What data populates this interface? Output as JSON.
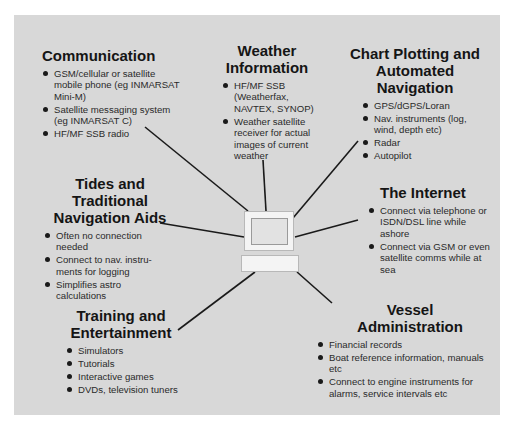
{
  "diagram": {
    "center": {
      "icon": "computer-icon"
    },
    "sections": {
      "communication": {
        "title": "Communication",
        "items": [
          "GSM/cellular or satellite mobile phone (eg INMARSAT Mini-M)",
          "Satellite messaging system (eg INMARSAT C)",
          "HF/MF SSB radio"
        ]
      },
      "weather": {
        "title_line1": "Weather",
        "title_line2": "Information",
        "items": [
          "HF/MF SSB (Weatherfax, NAVTEX, SYNOP)",
          "Weather satellite receiver for actual images of current weather"
        ]
      },
      "chart_plotting": {
        "title_line1": "Chart Plotting and",
        "title_line2": "Automated Navigation",
        "items": [
          "GPS/dGPS/Loran",
          "Nav. instruments (log, wind, depth etc)",
          "Radar",
          "Autopilot"
        ]
      },
      "tides": {
        "title_line1": "Tides and Traditional",
        "title_line2": "Navigation Aids",
        "items": [
          "Often no connection needed",
          "Connect to nav. instru-ments for logging",
          "Simplifies astro calculations"
        ]
      },
      "internet": {
        "title": "The Internet",
        "items": [
          "Connect via telephone or ISDN/DSL line while ashore",
          "Connect via GSM or even satellite comms while at sea"
        ]
      },
      "training": {
        "title_line1": "Training and",
        "title_line2": "Entertainment",
        "items": [
          "Simulators",
          "Tutorials",
          "Interactive games",
          "DVDs, television tuners"
        ]
      },
      "vessel": {
        "title_line1": "Vessel",
        "title_line2": "Administration",
        "items": [
          "Financial records",
          "Boat reference information, manuals etc",
          "Connect to engine instruments for alarms, service intervals etc"
        ]
      }
    },
    "colors": {
      "panel": "#d8d8d8",
      "line": "#1a1a1a",
      "text": "#1a1a1a"
    }
  }
}
